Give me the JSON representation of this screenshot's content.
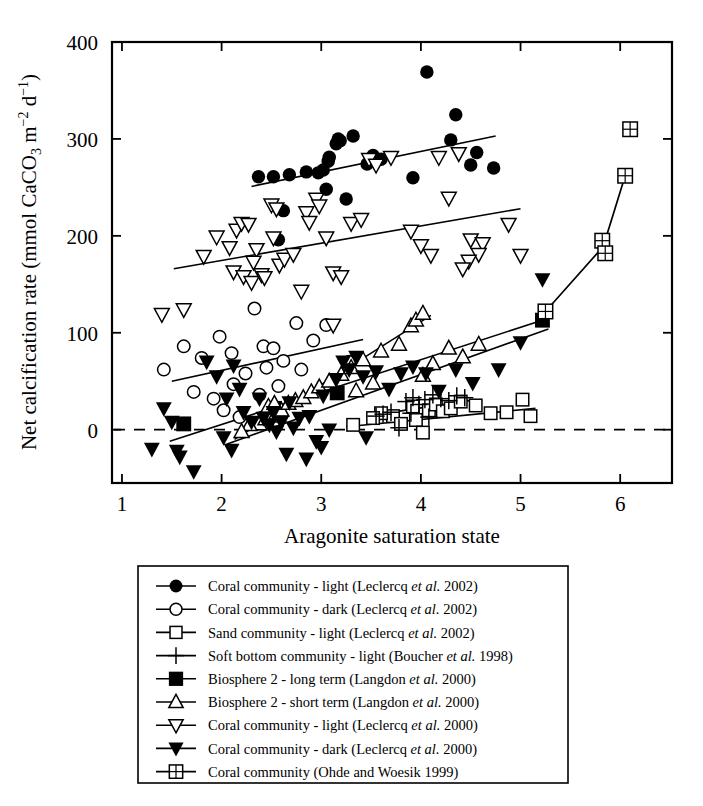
{
  "figure": {
    "title": "",
    "background": "#ffffff",
    "ink": "#000000"
  },
  "chart_data": {
    "type": "scatter",
    "title": "",
    "xlabel": "Aragonite saturation state",
    "ylabel": "Net calcification rate (mmol CaCO3 m-2 d-1)",
    "ylabel_parts": {
      "pre": "Net calcification rate (mmol CaCO",
      "sub1": "3",
      "mid": " m",
      "sup1": "−2",
      "mid2": " d",
      "sup2": "−1",
      "post": ")"
    },
    "xlim": [
      0.9,
      6.52
    ],
    "ylim": [
      -55,
      400
    ],
    "xticks": [
      1,
      2,
      3,
      4,
      5,
      6
    ],
    "xtick_labels": [
      "1",
      "2",
      "3",
      "4",
      "5",
      "6"
    ],
    "yticks": [
      0,
      100,
      200,
      300,
      400
    ],
    "ytick_labels": [
      "0",
      "100",
      "200",
      "300",
      "400"
    ],
    "grid": false,
    "zero_line": {
      "y": 0,
      "style": "dashed"
    },
    "legend_position": "below-plot",
    "series": [
      {
        "name": "Coral community - light (Leclercq et al. 2002)",
        "marker": "filled-circle",
        "points": [
          [
            2.37,
            261
          ],
          [
            2.52,
            261
          ],
          [
            2.68,
            263
          ],
          [
            2.85,
            266
          ],
          [
            2.97,
            265
          ],
          [
            3.02,
            268
          ],
          [
            3.07,
            277
          ],
          [
            3.08,
            281
          ],
          [
            3.15,
            295
          ],
          [
            3.05,
            248
          ],
          [
            3.17,
            300
          ],
          [
            3.19,
            298
          ],
          [
            3.32,
            303
          ],
          [
            3.25,
            238
          ],
          [
            3.46,
            274
          ],
          [
            3.52,
            283
          ],
          [
            3.6,
            279
          ],
          [
            4.06,
            369
          ],
          [
            3.92,
            260
          ],
          [
            4.35,
            325
          ],
          [
            4.3,
            299
          ],
          [
            4.56,
            286
          ],
          [
            4.5,
            273
          ],
          [
            4.73,
            270
          ],
          [
            2.62,
            226
          ],
          [
            2.57,
            196
          ]
        ]
      },
      {
        "name": "Coral community - dark (Leclercq et al. 2002)",
        "marker": "open-circle",
        "points": [
          [
            1.42,
            62
          ],
          [
            1.62,
            86
          ],
          [
            1.8,
            74
          ],
          [
            1.98,
            96
          ],
          [
            2.1,
            79
          ],
          [
            2.33,
            125
          ],
          [
            2.42,
            86
          ],
          [
            2.52,
            84
          ],
          [
            2.75,
            110
          ],
          [
            2.92,
            92
          ],
          [
            2.62,
            71
          ],
          [
            2.8,
            62
          ],
          [
            2.45,
            64
          ],
          [
            2.24,
            58
          ],
          [
            2.12,
            47
          ],
          [
            2.57,
            45
          ],
          [
            1.72,
            39
          ],
          [
            1.92,
            32
          ],
          [
            2.38,
            36
          ],
          [
            3.05,
            108
          ],
          [
            3.28,
            70
          ],
          [
            2.02,
            20
          ],
          [
            2.18,
            13
          ]
        ]
      },
      {
        "name": "Sand community - light (Leclercq et al. 2002)",
        "marker": "open-square",
        "points": [
          [
            3.32,
            5
          ],
          [
            3.72,
            14
          ],
          [
            3.8,
            6
          ],
          [
            3.92,
            24
          ],
          [
            3.95,
            10
          ],
          [
            4.08,
            20
          ],
          [
            4.15,
            26
          ],
          [
            4.22,
            19
          ],
          [
            4.3,
            22
          ],
          [
            4.4,
            29
          ],
          [
            4.55,
            25
          ],
          [
            4.7,
            17
          ],
          [
            4.86,
            18
          ],
          [
            5.02,
            31
          ],
          [
            5.1,
            14
          ],
          [
            3.6,
            17
          ],
          [
            3.52,
            12
          ],
          [
            4.02,
            -3
          ]
        ]
      },
      {
        "name": "Soft bottom community - light (Boucher et al. 1998)",
        "marker": "plus",
        "points": [
          [
            3.55,
            14
          ],
          [
            3.62,
            16
          ],
          [
            3.7,
            18
          ],
          [
            3.78,
            2
          ],
          [
            3.85,
            29
          ],
          [
            3.92,
            33
          ],
          [
            3.98,
            26
          ],
          [
            4.04,
            31
          ],
          [
            4.12,
            36
          ],
          [
            4.2,
            32
          ],
          [
            4.28,
            30
          ],
          [
            4.36,
            35
          ],
          [
            4.44,
            33
          ],
          [
            3.9,
            17
          ],
          [
            4.08,
            13
          ]
        ]
      },
      {
        "name": "Biosphere 2 - long term (Langdon et al. 2000)",
        "marker": "filled-square",
        "points": [
          [
            1.62,
            6
          ],
          [
            2.53,
            22
          ],
          [
            3.16,
            38
          ],
          [
            5.22,
            113
          ]
        ]
      },
      {
        "name": "Biosphere 2 - short term (Langdon et al. 2000)",
        "marker": "open-up-triangle",
        "points": [
          [
            2.38,
            6
          ],
          [
            2.44,
            11
          ],
          [
            2.5,
            14
          ],
          [
            2.55,
            17
          ],
          [
            2.6,
            20
          ],
          [
            2.47,
            24
          ],
          [
            2.53,
            27
          ],
          [
            2.67,
            27
          ],
          [
            2.74,
            30
          ],
          [
            2.82,
            33
          ],
          [
            2.9,
            39
          ],
          [
            2.98,
            44
          ],
          [
            3.08,
            50
          ],
          [
            3.2,
            57
          ],
          [
            3.3,
            64
          ],
          [
            3.42,
            72
          ],
          [
            3.6,
            81
          ],
          [
            3.78,
            88
          ],
          [
            3.9,
            107
          ],
          [
            3.95,
            113
          ],
          [
            4.02,
            120
          ],
          [
            4.28,
            84
          ],
          [
            4.12,
            68
          ],
          [
            4.02,
            56
          ],
          [
            3.52,
            48
          ],
          [
            3.35,
            40
          ],
          [
            2.28,
            5
          ],
          [
            2.2,
            -2
          ],
          [
            4.58,
            88
          ],
          [
            4.42,
            75
          ]
        ]
      },
      {
        "name": "Coral community - light (Leclercq et al. 2000)",
        "marker": "open-down-triangle",
        "points": [
          [
            1.4,
            119
          ],
          [
            1.62,
            124
          ],
          [
            1.82,
            179
          ],
          [
            1.95,
            199
          ],
          [
            2.08,
            188
          ],
          [
            2.15,
            206
          ],
          [
            2.2,
            213
          ],
          [
            2.27,
            212
          ],
          [
            2.12,
            163
          ],
          [
            2.22,
            158
          ],
          [
            2.3,
            152
          ],
          [
            2.4,
            160
          ],
          [
            2.43,
            157
          ],
          [
            2.35,
            186
          ],
          [
            2.32,
            173
          ],
          [
            2.5,
            232
          ],
          [
            2.55,
            228
          ],
          [
            2.52,
            198
          ],
          [
            2.58,
            170
          ],
          [
            2.63,
            176
          ],
          [
            2.72,
            181
          ],
          [
            2.8,
            143
          ],
          [
            2.85,
            224
          ],
          [
            2.95,
            238
          ],
          [
            2.98,
            231
          ],
          [
            2.88,
            214
          ],
          [
            3.05,
            198
          ],
          [
            3.12,
            162
          ],
          [
            3.2,
            158
          ],
          [
            3.3,
            213
          ],
          [
            3.4,
            217
          ],
          [
            3.48,
            279
          ],
          [
            3.55,
            273
          ],
          [
            3.7,
            281
          ],
          [
            3.9,
            205
          ],
          [
            4.0,
            190
          ],
          [
            4.1,
            180
          ],
          [
            4.18,
            281
          ],
          [
            4.38,
            285
          ],
          [
            4.28,
            239
          ],
          [
            4.5,
            196
          ],
          [
            4.62,
            192
          ],
          [
            4.58,
            181
          ],
          [
            4.48,
            174
          ],
          [
            4.42,
            166
          ],
          [
            4.88,
            212
          ],
          [
            5.0,
            180
          ],
          [
            3.12,
            108
          ]
        ]
      },
      {
        "name": "Coral community - dark (Leclercq et al. 2000)",
        "marker": "filled-down-triangle",
        "points": [
          [
            1.3,
            -20
          ],
          [
            1.42,
            22
          ],
          [
            1.55,
            -22
          ],
          [
            1.58,
            -28
          ],
          [
            1.72,
            -43
          ],
          [
            1.85,
            70
          ],
          [
            1.95,
            55
          ],
          [
            2.05,
            32
          ],
          [
            2.1,
            -21
          ],
          [
            2.12,
            66
          ],
          [
            2.18,
            42
          ],
          [
            2.22,
            18
          ],
          [
            2.3,
            8
          ],
          [
            2.38,
            32
          ],
          [
            2.42,
            12
          ],
          [
            2.48,
            5
          ],
          [
            2.52,
            18
          ],
          [
            2.55,
            -2
          ],
          [
            2.6,
            8
          ],
          [
            2.68,
            28
          ],
          [
            2.72,
            2
          ],
          [
            2.78,
            12
          ],
          [
            2.88,
            14
          ],
          [
            2.95,
            -12
          ],
          [
            3.08,
            0
          ],
          [
            3.02,
            35
          ],
          [
            3.15,
            52
          ],
          [
            3.22,
            70
          ],
          [
            3.28,
            62
          ],
          [
            3.35,
            75
          ],
          [
            3.42,
            55
          ],
          [
            3.55,
            60
          ],
          [
            3.68,
            42
          ],
          [
            3.8,
            58
          ],
          [
            3.92,
            65
          ],
          [
            4.05,
            58
          ],
          [
            4.18,
            40
          ],
          [
            4.35,
            62
          ],
          [
            4.52,
            48
          ],
          [
            4.78,
            62
          ],
          [
            5.0,
            90
          ],
          [
            5.22,
            155
          ],
          [
            1.5,
            8
          ],
          [
            2.02,
            -8
          ],
          [
            2.65,
            -25
          ],
          [
            3.0,
            -18
          ],
          [
            3.45,
            -8
          ],
          [
            2.85,
            -30
          ]
        ]
      },
      {
        "name": "Coral community (Ohde and Woesik 1999)",
        "marker": "crossed-square",
        "points": [
          [
            5.25,
            122
          ],
          [
            5.82,
            195
          ],
          [
            5.85,
            182
          ],
          [
            6.05,
            262
          ],
          [
            6.1,
            310
          ]
        ],
        "connected": true,
        "connect_points": [
          [
            5.25,
            122
          ],
          [
            5.83,
            189
          ],
          [
            6.05,
            262
          ]
        ]
      }
    ],
    "trend_lines": [
      {
        "series": "Coral community - light (Leclercq et al. 2002)",
        "x1": 2.3,
        "y1": 251,
        "x2": 4.75,
        "y2": 303
      },
      {
        "series": "Coral community - light (Leclercq et al. 2000)",
        "x1": 1.52,
        "y1": 166,
        "x2": 5.0,
        "y2": 228
      },
      {
        "series": "Coral community - dark (Leclercq et al. 2002)",
        "x1": 1.5,
        "y1": 50,
        "x2": 3.42,
        "y2": 93
      },
      {
        "series": "Biosphere 2 - short term (Langdon et al. 2000)",
        "x1": 2.13,
        "y1": -10,
        "x2": 4.1,
        "y2": 118
      },
      {
        "series": "Biosphere 2 - long term (Langdon et al. 2000)",
        "x1": 1.48,
        "y1": -12,
        "x2": 5.28,
        "y2": 115
      },
      {
        "series": "Coral community - dark (Leclercq et al. 2000)",
        "x1": 2.05,
        "y1": -15,
        "x2": 5.28,
        "y2": 104
      },
      {
        "series": "Sand community - light (Leclercq et al. 2002)",
        "x1": 3.25,
        "y1": 3,
        "x2": 5.15,
        "y2": 22
      },
      {
        "series": "Soft bottom community - light (Boucher et al. 1998)",
        "x1": 3.45,
        "y1": 14,
        "x2": 4.55,
        "y2": 31
      }
    ]
  },
  "legend": {
    "items": [
      {
        "marker": "filled-circle",
        "label": "Coral community - light (Leclercq ",
        "italic": "et al.",
        "tail": " 2002)"
      },
      {
        "marker": "open-circle",
        "label": "Coral community - dark (Leclercq ",
        "italic": "et al.",
        "tail": " 2002)"
      },
      {
        "marker": "open-square",
        "label": "Sand community - light (Leclercq ",
        "italic": "et al.",
        "tail": " 2002)"
      },
      {
        "marker": "plus",
        "label": "Soft bottom community - light (Boucher ",
        "italic": "et al.",
        "tail": " 1998)"
      },
      {
        "marker": "filled-square",
        "label": "Biosphere 2 - long term (Langdon ",
        "italic": "et al.",
        "tail": " 2000)"
      },
      {
        "marker": "open-up-triangle",
        "label": "Biosphere 2 - short term (Langdon ",
        "italic": "et al.",
        "tail": " 2000)"
      },
      {
        "marker": "open-down-triangle",
        "label": "Coral community - light (Leclercq ",
        "italic": "et al.",
        "tail": " 2000)"
      },
      {
        "marker": "filled-down-triangle",
        "label": "Coral community - dark (Leclercq ",
        "italic": "et al.",
        "tail": " 2000)"
      },
      {
        "marker": "crossed-square",
        "label": "Coral community (Ohde and Woesik 1999)",
        "italic": "",
        "tail": ""
      }
    ]
  }
}
